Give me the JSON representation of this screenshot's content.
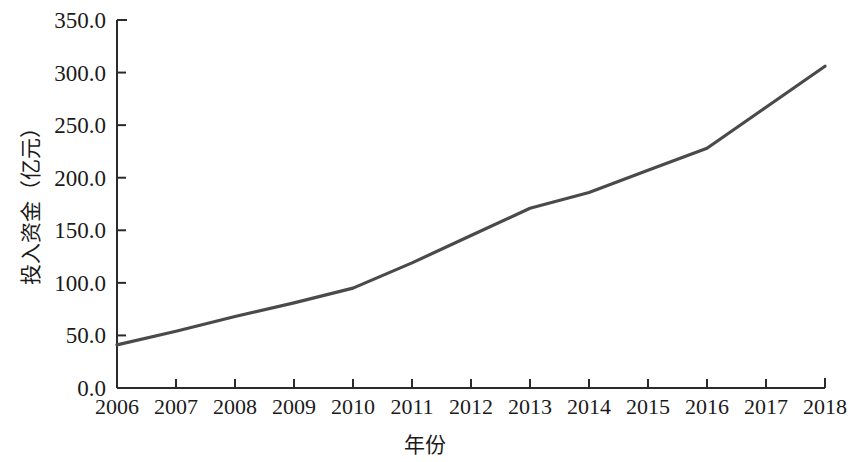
{
  "chart_data": {
    "type": "line",
    "title": "",
    "xlabel": "年份",
    "ylabel": "投入资金（亿元）",
    "categories": [
      "2006",
      "2007",
      "2008",
      "2009",
      "2010",
      "2011",
      "2012",
      "2013",
      "2014",
      "2015",
      "2016",
      "2017",
      "2018"
    ],
    "x": [
      2006,
      2007,
      2008,
      2009,
      2010,
      2011,
      2012,
      2013,
      2014,
      2015,
      2016,
      2017,
      2018
    ],
    "values": [
      41,
      54,
      68,
      81,
      95,
      119,
      145,
      171,
      186,
      207,
      228,
      267,
      306
    ],
    "series": [
      {
        "name": "投入资金",
        "values": [
          41,
          54,
          68,
          81,
          95,
          119,
          145,
          171,
          186,
          207,
          228,
          267,
          306
        ]
      }
    ],
    "ylim": [
      0,
      350
    ],
    "ytick_labels": [
      "0.0",
      "50.0",
      "100.0",
      "150.0",
      "200.0",
      "250.0",
      "300.0",
      "350.0"
    ],
    "ytick_values": [
      0,
      50,
      100,
      150,
      200,
      250,
      300,
      350
    ],
    "xlim": [
      2006,
      2018
    ],
    "grid": false,
    "legend": null,
    "line_color": "#4a4a4a",
    "axis_color": "#2b2b2b",
    "markers": false
  }
}
